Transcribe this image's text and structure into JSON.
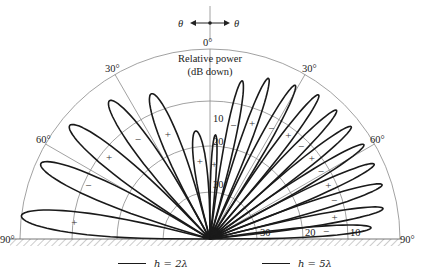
{
  "orientation": {
    "left_label": "θ",
    "right_label": "θ"
  },
  "axis": {
    "title_line1": "Relative power",
    "title_line2": "(dB down)",
    "angle_labels": [
      {
        "text": "0°",
        "angle": 0,
        "side": "top"
      },
      {
        "text": "30°",
        "angle": -30,
        "side": "left"
      },
      {
        "text": "30°",
        "angle": 30,
        "side": "right"
      },
      {
        "text": "60°",
        "angle": -60,
        "side": "left"
      },
      {
        "text": "60°",
        "angle": 60,
        "side": "right"
      },
      {
        "text": "90°",
        "angle": -90,
        "side": "left"
      },
      {
        "text": "90°",
        "angle": 90,
        "side": "right"
      }
    ],
    "ring_labels_vertical": [
      "10",
      "20",
      "30"
    ],
    "ring_labels_horizontal": [
      "30",
      "20",
      "10"
    ]
  },
  "legend": {
    "left": "h = 2λ",
    "right": "h = 5λ"
  },
  "chart_data": {
    "type": "polar",
    "angular_range_deg": [
      -90,
      90
    ],
    "radial_rings_db": [
      0,
      10,
      20,
      30
    ],
    "series": [
      {
        "name": "h = 2λ",
        "side": "left",
        "lobes": [
          {
            "center_deg": -7.5,
            "peak_db_down": 17,
            "sign": "+"
          },
          {
            "center_deg": -22,
            "peak_db_down": 7,
            "sign": "+"
          },
          {
            "center_deg": -36,
            "peak_db_down": 4,
            "sign": "-"
          },
          {
            "center_deg": -51,
            "peak_db_down": 2,
            "sign": "+"
          },
          {
            "center_deg": -66,
            "peak_db_down": 1,
            "sign": "-"
          },
          {
            "center_deg": -83,
            "peak_db_down": 0,
            "sign": "+"
          }
        ]
      },
      {
        "name": "h = 5λ",
        "side": "right",
        "lobes": [
          {
            "center_deg": 3,
            "peak_db_down": 18,
            "sign": "+"
          },
          {
            "center_deg": 11.5,
            "peak_db_down": 6,
            "sign": "-"
          },
          {
            "center_deg": 20,
            "peak_db_down": 4,
            "sign": "+"
          },
          {
            "center_deg": 29,
            "peak_db_down": 3,
            "sign": "-"
          },
          {
            "center_deg": 37,
            "peak_db_down": 2,
            "sign": "+"
          },
          {
            "center_deg": 44.5,
            "peak_db_down": 2,
            "sign": "-"
          },
          {
            "center_deg": 51.5,
            "peak_db_down": 2,
            "sign": "+"
          },
          {
            "center_deg": 58.5,
            "peak_db_down": 2,
            "sign": "-"
          },
          {
            "center_deg": 65.5,
            "peak_db_down": 2,
            "sign": "+"
          },
          {
            "center_deg": 72.5,
            "peak_db_down": 2,
            "sign": "-"
          },
          {
            "center_deg": 80,
            "peak_db_down": 3,
            "sign": "+"
          },
          {
            "center_deg": 86,
            "peak_db_down": 6,
            "sign": "-"
          }
        ]
      }
    ],
    "annotations": [
      "θ ← • → θ",
      "ground plane (hatched) at 90°"
    ],
    "legend_position": "bottom"
  }
}
